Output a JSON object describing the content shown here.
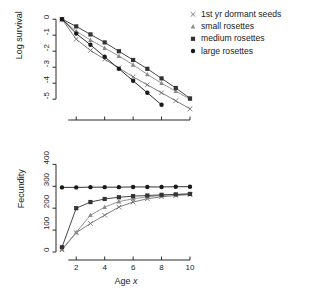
{
  "figure": {
    "background": "#ffffff",
    "ink": "#1a1a1a"
  },
  "legend": {
    "position": "top-right",
    "entries": [
      {
        "label": "1st yr dormant seeds",
        "marker": "cross-marker",
        "symbol": "×",
        "color": "#6e6e6e"
      },
      {
        "label": "small rosettes",
        "marker": "triangle-marker",
        "symbol": "▲",
        "color": "#8a8a8a"
      },
      {
        "label": "medium rosettes",
        "marker": "square-marker",
        "symbol": "■",
        "color": "#333333"
      },
      {
        "label": "large rosettes",
        "marker": "circle-marker",
        "symbol": "●",
        "color": "#1a1a1a"
      }
    ]
  },
  "chart_data": [
    {
      "type": "line",
      "panel": "top",
      "title": "",
      "xlabel": "",
      "ylabel": "Log survival",
      "x": [
        1,
        2,
        3,
        4,
        5,
        6,
        7,
        8,
        9,
        10
      ],
      "xlim": [
        1,
        10
      ],
      "ylim": [
        -5.8,
        0.2
      ],
      "yticks": [
        0,
        -1,
        -2,
        -3,
        -4,
        -5
      ],
      "ytick_labels": [
        "0",
        "-1",
        "-2",
        "-3",
        "-4",
        "-5"
      ],
      "xticks": [
        2,
        4,
        6,
        8,
        10
      ],
      "xtick_labels": [
        "",
        "",
        "",
        "",
        ""
      ],
      "grid": false,
      "series": [
        {
          "name": "1st yr dormant seeds",
          "marker": "cross-marker",
          "color": "#6e6e6e",
          "values": [
            0,
            -1.25,
            -1.95,
            -2.5,
            -3.05,
            -3.6,
            -4.1,
            -4.6,
            -5.1,
            -5.6
          ]
        },
        {
          "name": "small rosettes",
          "marker": "triangle-marker",
          "color": "#8a8a8a",
          "values": [
            0,
            -0.75,
            -1.3,
            -1.8,
            -2.3,
            -2.85,
            -3.45,
            -4.0,
            -4.5,
            -5.0
          ]
        },
        {
          "name": "medium rosettes",
          "marker": "square-marker",
          "color": "#333333",
          "values": [
            0,
            -0.45,
            -0.95,
            -1.45,
            -2.0,
            -2.55,
            -3.1,
            -3.7,
            -4.3,
            -4.95
          ]
        },
        {
          "name": "large rosettes",
          "marker": "circle-marker",
          "color": "#1a1a1a",
          "values": [
            0,
            -0.9,
            -1.6,
            -2.35,
            -3.1,
            -3.85,
            -4.6,
            -5.35,
            null,
            null
          ]
        }
      ]
    },
    {
      "type": "line",
      "panel": "bottom",
      "title": "",
      "xlabel": "Age x",
      "xlabel_italic_part": "x",
      "ylabel": "Fecundity",
      "x": [
        1,
        2,
        3,
        4,
        5,
        6,
        7,
        8,
        9,
        10
      ],
      "xlim": [
        1,
        10
      ],
      "ylim": [
        0,
        420
      ],
      "yticks": [
        0,
        100,
        200,
        300,
        400
      ],
      "ytick_labels": [
        "0",
        "100",
        "200",
        "300",
        "400"
      ],
      "xticks": [
        2,
        4,
        6,
        8,
        10
      ],
      "xtick_labels": [
        "2",
        "4",
        "6",
        "8",
        "10"
      ],
      "grid": false,
      "series": [
        {
          "name": "1st yr dormant seeds",
          "marker": "cross-marker",
          "color": "#6e6e6e",
          "values": [
            10,
            88,
            130,
            168,
            205,
            228,
            243,
            252,
            258,
            262
          ]
        },
        {
          "name": "small rosettes",
          "marker": "triangle-marker",
          "color": "#8a8a8a",
          "values": [
            12,
            90,
            168,
            205,
            230,
            243,
            252,
            258,
            262,
            265
          ]
        },
        {
          "name": "medium rosettes",
          "marker": "square-marker",
          "color": "#333333",
          "values": [
            22,
            200,
            228,
            242,
            250,
            255,
            258,
            261,
            263,
            265
          ]
        },
        {
          "name": "large rosettes",
          "marker": "circle-marker",
          "color": "#1a1a1a",
          "values": [
            295,
            295,
            296,
            296,
            296,
            297,
            297,
            297,
            298,
            298
          ]
        }
      ]
    }
  ]
}
